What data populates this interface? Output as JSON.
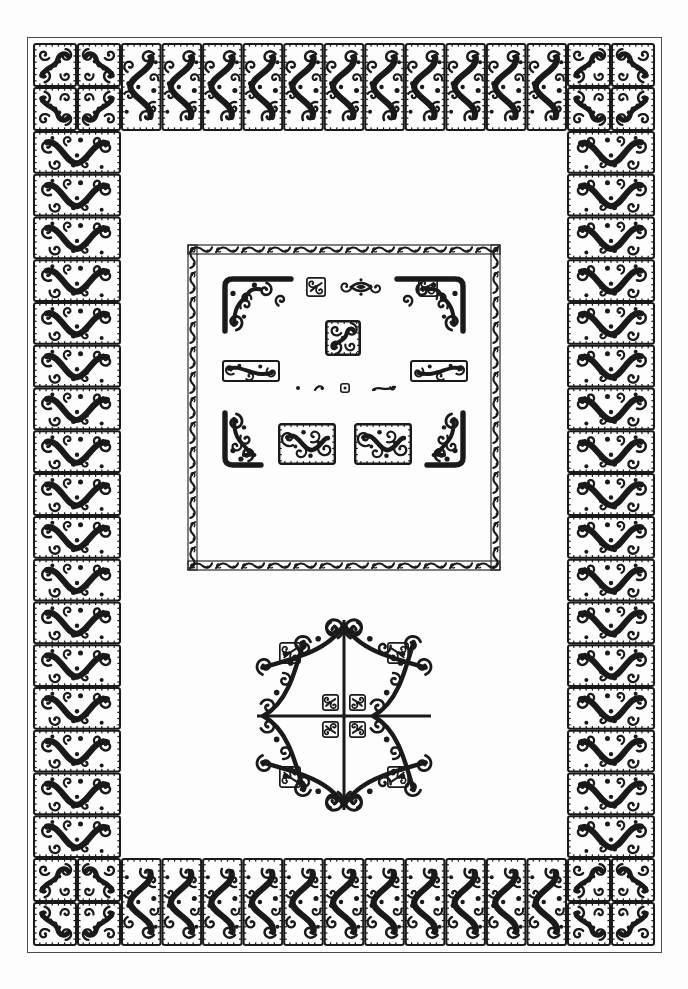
{
  "plate": {
    "title": "Ornamental Border and Vignette Specimen Plate",
    "style_name": "Celtic-Hiberno Saxon spiral scrollwork",
    "medium": "Line engraving, black ink on white ground",
    "page": {
      "width": 688,
      "height": 989,
      "background_color": "#ffffff",
      "ink_color": "#1a1a1a",
      "hairline_color": "#4a4a4a"
    }
  },
  "outer_frame": {
    "name": "Full-page ornamental border",
    "bounds": {
      "x": 33,
      "y": 43,
      "width": 622,
      "height": 903
    },
    "hairline_rule": {
      "x": 27,
      "y": 37,
      "width": 634,
      "height": 915
    },
    "corner_block": {
      "name": "corner-rosette-quad",
      "size": 88,
      "description": "Four square spiral tiles arranged 2x2 forming a quatrefoil corner",
      "tile_size": 44,
      "count": 4
    },
    "top_band": {
      "tile_count": 11,
      "tile_width": 44,
      "tile_height": 88,
      "motif": "vertical-s-scroll"
    },
    "bottom_band": {
      "tile_count": 11,
      "tile_width": 44,
      "tile_height": 88,
      "motif": "vertical-s-scroll"
    },
    "left_band": {
      "tile_count": 17,
      "tile_width": 88,
      "tile_height": 44,
      "motif": "horizontal-s-scroll"
    },
    "right_band": {
      "tile_count": 17,
      "tile_width": 88,
      "tile_height": 44,
      "motif": "horizontal-s-scroll"
    }
  },
  "inner_panel": {
    "name": "Square specimen panel",
    "bounds": {
      "x": 188,
      "y": 245,
      "width": 312,
      "height": 325
    },
    "frame": {
      "motif": "running-wave-guilloche",
      "band_width": 9,
      "repeat_length": 26
    },
    "contents": {
      "corner_brackets": [
        {
          "name": "bracket-top-left",
          "x": 222,
          "y": 276,
          "w": 72,
          "h": 58,
          "orientation": "top-left"
        },
        {
          "name": "bracket-top-right",
          "x": 394,
          "y": 276,
          "w": 72,
          "h": 58,
          "orientation": "top-right"
        },
        {
          "name": "bracket-bottom-left",
          "x": 222,
          "y": 410,
          "w": 42,
          "h": 58,
          "orientation": "bottom-left"
        },
        {
          "name": "bracket-bottom-right",
          "x": 424,
          "y": 410,
          "w": 42,
          "h": 58,
          "orientation": "bottom-right"
        }
      ],
      "small_squares": [
        {
          "name": "small-square-a",
          "x": 306,
          "y": 277,
          "size": 20
        },
        {
          "name": "small-square-b",
          "x": 418,
          "y": 277,
          "size": 20
        }
      ],
      "lozenges": [
        {
          "name": "eye-lozenge",
          "x": 340,
          "y": 278,
          "w": 42,
          "h": 18
        }
      ],
      "center_square": {
        "name": "center-rosette-square",
        "x": 325,
        "y": 320,
        "size": 36
      },
      "side_bars": [
        {
          "name": "side-bar-left",
          "x": 222,
          "y": 360,
          "w": 58,
          "h": 22
        },
        {
          "name": "side-bar-right",
          "x": 410,
          "y": 360,
          "w": 58,
          "h": 22
        }
      ],
      "micro_row": [
        {
          "name": "micro-dot",
          "x": 296,
          "y": 386,
          "size": 4
        },
        {
          "name": "micro-comma",
          "x": 315,
          "y": 385,
          "size": 8
        },
        {
          "name": "micro-square",
          "x": 340,
          "y": 383,
          "size": 10
        },
        {
          "name": "micro-wave",
          "x": 372,
          "y": 384,
          "w": 24,
          "h": 9
        }
      ],
      "bottom_blocks": [
        {
          "name": "block-left",
          "x": 278,
          "y": 423,
          "w": 58,
          "h": 42
        },
        {
          "name": "block-right",
          "x": 354,
          "y": 423,
          "w": 58,
          "h": 42
        }
      ]
    }
  },
  "medallion": {
    "name": "Quartered cross vignette",
    "bounds": {
      "x": 249,
      "y": 612,
      "width": 190,
      "height": 206
    },
    "description": "Four-armed cross with spiral terminal scrolls, quatrefoil corner florets and four interior knot florets",
    "cross": {
      "vertical_x": 344,
      "horizontal_y": 716,
      "stroke": 3
    },
    "corner_florets": 4,
    "interior_florets": 4,
    "arm_scrolls": 8
  },
  "legend": {
    "ornament_count_total": 23,
    "border_tile_motif": "s-scroll",
    "panel_frame_motif": "running-wave"
  }
}
